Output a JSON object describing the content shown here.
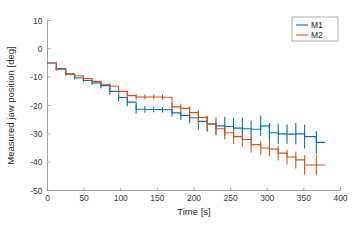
{
  "chart_data": {
    "type": "line",
    "title": "",
    "xlabel": "Time [s]",
    "ylabel": "Measured jaw position [deg]",
    "xlim": [
      0,
      400
    ],
    "ylim": [
      -50,
      10
    ],
    "xticks": [
      0,
      50,
      100,
      150,
      200,
      250,
      300,
      350,
      400
    ],
    "yticks": [
      10,
      0,
      -10,
      -20,
      -30,
      -40,
      -50
    ],
    "grid": false,
    "legend_position": "top-right",
    "style": "stairs-with-errorbars",
    "series": [
      {
        "name": "M1",
        "color": "#0072BD",
        "x": [
          0,
          12,
          25,
          37,
          49,
          61,
          73,
          85,
          97,
          109,
          121,
          133,
          145,
          157,
          170,
          182,
          194,
          206,
          218,
          230,
          242,
          254,
          266,
          278,
          291,
          303,
          315,
          327,
          339,
          351,
          367
        ],
        "y": [
          -5.0,
          -7.0,
          -8.8,
          -10.2,
          -11.2,
          -12.0,
          -13.0,
          -15.0,
          -17.2,
          -18.8,
          -21.3,
          -21.4,
          -21.4,
          -21.5,
          -22.6,
          -23.5,
          -24.3,
          -25.6,
          -26.5,
          -27.2,
          -27.4,
          -28.0,
          -28.2,
          -28.4,
          -27.2,
          -29.6,
          -30.0,
          -30.1,
          -30.0,
          -31.0,
          -33.0
        ],
        "yerr": [
          0.3,
          0.5,
          0.5,
          0.6,
          0.6,
          0.8,
          1.0,
          1.2,
          1.4,
          1.5,
          1.6,
          1.2,
          1.0,
          1.0,
          1.3,
          1.6,
          2.0,
          3.0,
          2.6,
          3.0,
          3.4,
          3.6,
          3.8,
          3.0,
          3.6,
          3.4,
          3.6,
          3.4,
          3.8,
          4.2,
          4.0
        ]
      },
      {
        "name": "M2",
        "color": "#D95319",
        "x": [
          0,
          12,
          25,
          37,
          49,
          61,
          73,
          85,
          97,
          109,
          121,
          133,
          145,
          157,
          170,
          182,
          194,
          206,
          218,
          230,
          242,
          254,
          266,
          278,
          291,
          303,
          315,
          327,
          339,
          351,
          367
        ],
        "y": [
          -5.0,
          -7.2,
          -9.0,
          -9.5,
          -10.5,
          -11.5,
          -12.5,
          -13.2,
          -15.0,
          -16.5,
          -17.0,
          -17.0,
          -17.0,
          -17.1,
          -20.5,
          -21.0,
          -22.5,
          -24.2,
          -26.5,
          -28.2,
          -29.6,
          -31.0,
          -32.0,
          -33.8,
          -35.0,
          -35.4,
          -36.8,
          -38.2,
          -39.2,
          -41.0,
          -41.0
        ],
        "yerr": [
          0.3,
          0.5,
          0.5,
          0.5,
          0.6,
          0.6,
          0.8,
          0.9,
          1.0,
          1.2,
          1.0,
          0.9,
          0.9,
          1.0,
          1.4,
          1.6,
          2.2,
          2.6,
          2.8,
          2.2,
          2.4,
          2.6,
          2.6,
          2.8,
          2.4,
          2.4,
          2.6,
          2.6,
          3.0,
          3.4,
          3.4
        ]
      }
    ],
    "legend": [
      {
        "label": "M1",
        "color": "#0072BD"
      },
      {
        "label": "M2",
        "color": "#D95319"
      }
    ]
  }
}
